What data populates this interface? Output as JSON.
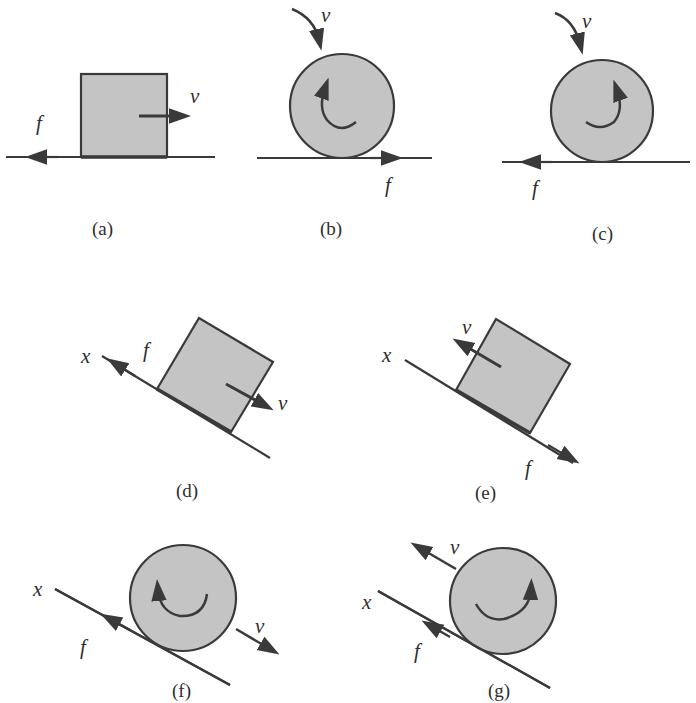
{
  "figure": {
    "panels": [
      {
        "id": "a",
        "caption": "(a)",
        "object": "block",
        "surface": "horizontal",
        "velocity_label": "v",
        "velocity_direction": "right",
        "friction_label": "f",
        "friction_direction": "left"
      },
      {
        "id": "b",
        "caption": "(b)",
        "object": "wheel",
        "surface": "horizontal",
        "velocity_label": "v",
        "rotation": "counterclockwise",
        "friction_label": "f",
        "friction_direction": "right"
      },
      {
        "id": "c",
        "caption": "(c)",
        "object": "wheel",
        "surface": "horizontal",
        "velocity_label": "v",
        "rotation": "clockwise",
        "friction_label": "f",
        "friction_direction": "left"
      },
      {
        "id": "d",
        "caption": "(d)",
        "object": "block",
        "surface": "incline",
        "axis_label": "x",
        "velocity_label": "v",
        "velocity_direction": "down-slope",
        "friction_label": "f",
        "friction_direction": "up-slope"
      },
      {
        "id": "e",
        "caption": "(e)",
        "object": "block",
        "surface": "incline",
        "axis_label": "x",
        "velocity_label": "v",
        "velocity_direction": "up-slope",
        "friction_label": "f",
        "friction_direction": "down-slope"
      },
      {
        "id": "f",
        "caption": "(f)",
        "object": "wheel",
        "surface": "incline",
        "axis_label": "x",
        "velocity_label": "v",
        "velocity_direction": "down-slope",
        "rotation": "counterclockwise",
        "friction_label": "f",
        "friction_direction": "up-slope"
      },
      {
        "id": "g",
        "caption": "(g)",
        "object": "wheel",
        "surface": "incline",
        "axis_label": "x",
        "velocity_label": "v",
        "velocity_direction": "up-slope",
        "rotation": "clockwise",
        "friction_label": "f",
        "friction_direction": "up-slope"
      }
    ]
  },
  "colors": {
    "body_fill": "#c4c4c4",
    "stroke": "#3a3a3a",
    "background": "#ffffff"
  }
}
